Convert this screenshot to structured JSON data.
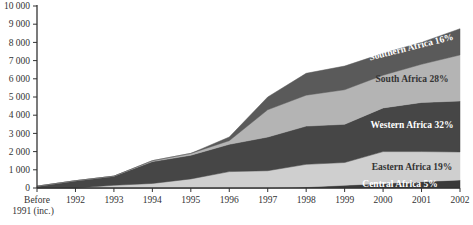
{
  "chart_data": {
    "type": "area",
    "stacked": true,
    "title": "",
    "xlabel": "",
    "ylabel": "",
    "categories": [
      "Before 1991 (inc.)",
      "1992",
      "1993",
      "1994",
      "1995",
      "1996",
      "1997",
      "1998",
      "1999",
      "2000",
      "2001",
      "2002"
    ],
    "x_tick_labels": [
      [
        "Before",
        "1991 (inc.)"
      ],
      [
        "1992"
      ],
      [
        "1993"
      ],
      [
        "1994"
      ],
      [
        "1995"
      ],
      [
        "1996"
      ],
      [
        "1997"
      ],
      [
        "1998"
      ],
      [
        "1999"
      ],
      [
        "2000"
      ],
      [
        "2001"
      ],
      [
        "2002"
      ]
    ],
    "ylim": [
      0,
      10000
    ],
    "y_ticks": [
      0,
      1000,
      2000,
      3000,
      4000,
      5000,
      6000,
      7000,
      8000,
      9000,
      10000
    ],
    "y_tick_labels": [
      "0",
      "1 000",
      "2 000",
      "3 000",
      "4 000",
      "5 000",
      "6 000",
      "7 000",
      "8 000",
      "9 000",
      "10 000"
    ],
    "grid": false,
    "legend": "inline labels on right",
    "series": [
      {
        "name": "Central Africa",
        "label": "Central Africa 5%",
        "color": "#3a3a3a",
        "label_color": "#ffffff",
        "values": [
          0,
          0,
          0,
          0,
          0,
          0,
          0,
          50,
          150,
          250,
          350,
          440
        ]
      },
      {
        "name": "Eastern Africa",
        "label": "Eastern Africa 19%",
        "color": "#cfcfcf",
        "label_color": "#333333",
        "values": [
          0,
          0,
          150,
          250,
          500,
          900,
          950,
          1250,
          1250,
          1750,
          1650,
          1540
        ]
      },
      {
        "name": "Western Africa",
        "label": "Western Africa 32%",
        "color": "#464646",
        "label_color": "#ffffff",
        "values": [
          100,
          400,
          500,
          1200,
          1300,
          1500,
          1850,
          2100,
          2100,
          2400,
          2700,
          2800
        ]
      },
      {
        "name": "South Africa",
        "label": "South Africa 28%",
        "color": "#b4b4b4",
        "label_color": "#333333",
        "values": [
          0,
          0,
          0,
          50,
          100,
          200,
          1500,
          1700,
          1900,
          1800,
          2100,
          2530
        ]
      },
      {
        "name": "Southern Africa",
        "label": "Southern Africa 16%",
        "color": "#5a5a5a",
        "label_color": "#ffffff",
        "values": [
          0,
          0,
          0,
          0,
          0,
          200,
          700,
          1200,
          1300,
          1200,
          1200,
          1440
        ]
      }
    ]
  }
}
